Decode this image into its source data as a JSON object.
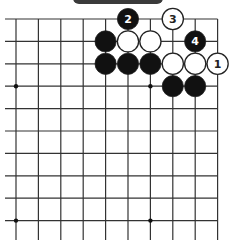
{
  "diagram": {
    "type": "go-board-partial",
    "caption_bar": {
      "color": "#3a3a3a",
      "text": ""
    },
    "grid": {
      "columns": 10,
      "rows": 10,
      "origin_x": 16,
      "origin_y": 19,
      "spacing": 22.4,
      "left_extension_x": 5,
      "bottom_extension_y": 240,
      "line_color": "#333333"
    },
    "star_points": [
      {
        "col": 0,
        "row": 3
      },
      {
        "col": 6,
        "row": 3
      },
      {
        "col": 0,
        "row": 9
      },
      {
        "col": 6,
        "row": 9
      }
    ],
    "stones": [
      {
        "col": 5,
        "row": 0,
        "color": "black",
        "label": "2"
      },
      {
        "col": 7,
        "row": 0,
        "color": "white",
        "label": "3"
      },
      {
        "col": 4,
        "row": 1,
        "color": "black",
        "label": ""
      },
      {
        "col": 5,
        "row": 1,
        "color": "white",
        "label": ""
      },
      {
        "col": 6,
        "row": 1,
        "color": "white",
        "label": ""
      },
      {
        "col": 8,
        "row": 1,
        "color": "black",
        "label": "4"
      },
      {
        "col": 4,
        "row": 2,
        "color": "black",
        "label": ""
      },
      {
        "col": 5,
        "row": 2,
        "color": "black",
        "label": ""
      },
      {
        "col": 6,
        "row": 2,
        "color": "black",
        "label": ""
      },
      {
        "col": 7,
        "row": 2,
        "color": "white",
        "label": ""
      },
      {
        "col": 8,
        "row": 2,
        "color": "white",
        "label": ""
      },
      {
        "col": 9,
        "row": 2,
        "color": "white",
        "label": "1"
      },
      {
        "col": 7,
        "row": 3,
        "color": "black",
        "label": ""
      },
      {
        "col": 8,
        "row": 3,
        "color": "black",
        "label": ""
      }
    ]
  }
}
